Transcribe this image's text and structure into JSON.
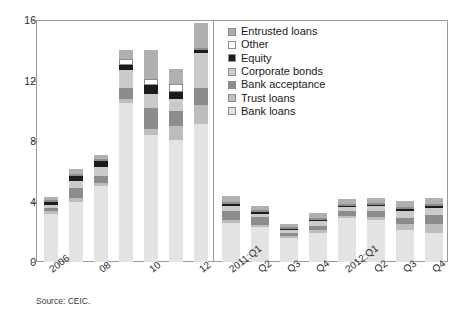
{
  "figure": {
    "source_note": "Source: CEIC.",
    "divider_x_note": "panel separator between annual and quarterly data"
  },
  "chart_data": {
    "type": "bar",
    "title": "",
    "subtitle": "",
    "xlabel": "",
    "ylabel": "",
    "ylim": [
      0,
      16
    ],
    "yticks": [
      0,
      4,
      8,
      12,
      16
    ],
    "ytick_labels": [
      "0",
      "4",
      "8",
      "12",
      "16"
    ],
    "grid": false,
    "stacked": true,
    "legend_position": "top-right inside",
    "legend_order_top_to_bottom": [
      "Entrusted loans",
      "Other",
      "Equity",
      "Corporate bonds",
      "Bank acceptance",
      "Trust loans",
      "Bank loans"
    ],
    "stack_order_bottom_to_top": [
      "Bank loans",
      "Trust loans",
      "Bank acceptance",
      "Corporate bonds",
      "Equity",
      "Other",
      "Entrusted loans"
    ],
    "categories": [
      "2006",
      "07",
      "08",
      "09",
      "10",
      "11",
      "12",
      "2011:Q1",
      "Q2",
      "Q3",
      "Q4",
      "2012:Q1",
      "Q2",
      "Q3",
      "Q4"
    ],
    "visible_tick_labels": [
      "2006",
      "08",
      "10",
      "12",
      "2011:Q1",
      "Q2",
      "Q3",
      "Q4",
      "2012:Q1",
      "Q2",
      "Q3",
      "Q4"
    ],
    "panels": [
      {
        "name": "annual",
        "categories": [
          "2006",
          "07",
          "08",
          "09",
          "10",
          "11",
          "12"
        ]
      },
      {
        "name": "quarterly",
        "categories": [
          "2011:Q1",
          "Q2",
          "Q3",
          "Q4",
          "2012:Q1",
          "Q2",
          "Q3",
          "Q4"
        ]
      }
    ],
    "series": [
      {
        "name": "Bank loans",
        "color": "#e3e3e3",
        "values": [
          3.2,
          4.0,
          5.0,
          10.5,
          8.4,
          8.1,
          9.1,
          2.6,
          2.3,
          1.6,
          1.9,
          2.9,
          2.8,
          2.1,
          1.9
        ]
      },
      {
        "name": "Trust loans",
        "color": "#bdbdbd",
        "values": [
          0.15,
          0.2,
          0.2,
          0.3,
          0.4,
          0.9,
          1.3,
          0.2,
          0.15,
          0.1,
          0.2,
          0.15,
          0.2,
          0.4,
          0.6
        ]
      },
      {
        "name": "Bank acceptance",
        "color": "#8c8c8c",
        "values": [
          0.2,
          0.7,
          0.5,
          0.7,
          1.4,
          1.0,
          1.1,
          0.6,
          0.5,
          0.2,
          0.3,
          0.3,
          0.4,
          0.4,
          0.6
        ]
      },
      {
        "name": "Corporate bonds",
        "color": "#cbcbcb",
        "values": [
          0.25,
          0.45,
          0.6,
          1.2,
          0.9,
          0.8,
          2.3,
          0.3,
          0.25,
          0.2,
          0.3,
          0.3,
          0.3,
          0.5,
          0.5
        ]
      },
      {
        "name": "Equity",
        "color": "#1c1c1c",
        "values": [
          0.15,
          0.35,
          0.35,
          0.35,
          0.6,
          0.45,
          0.25,
          0.12,
          0.1,
          0.08,
          0.1,
          0.08,
          0.08,
          0.08,
          0.08
        ]
      },
      {
        "name": "Other",
        "color": "#ffffff",
        "values": [
          0.05,
          0.05,
          0.05,
          0.35,
          0.4,
          0.5,
          0.1,
          0.05,
          0.05,
          0.04,
          0.05,
          0.04,
          0.04,
          0.04,
          0.04
        ]
      },
      {
        "name": "Entrusted loans",
        "color": "#b0b0b0",
        "values": [
          0.25,
          0.3,
          0.3,
          0.6,
          1.9,
          1.0,
          1.6,
          0.4,
          0.3,
          0.2,
          0.3,
          0.3,
          0.3,
          0.4,
          0.4
        ]
      }
    ],
    "totals": [
      4.3,
      6.05,
      7.0,
      14.0,
      14.0,
      12.75,
      15.75,
      4.27,
      3.65,
      2.38,
      3.15,
      4.07,
      4.12,
      3.98,
      4.12
    ]
  }
}
